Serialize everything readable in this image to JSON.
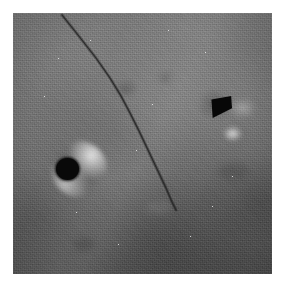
{
  "figure": {
    "kind": "grayscale-micrograph",
    "page_background": "#ffffff",
    "plate": {
      "x": 13,
      "y": 13,
      "width": 259,
      "height": 261,
      "base_gray": "#6e6e6e",
      "lightest_gray": "#8f8f8f",
      "darkest_gray": "#3a3a3a",
      "texture": "fine granular noise with horizontal scan striations"
    },
    "illumination": {
      "direction": "bright toward upper-left and a diagonal mid band, darkening toward lower-right",
      "band_angle_deg": 118
    },
    "features": [
      {
        "name": "dark-circular-particle",
        "shape": "circle",
        "center_x": 67,
        "center_y": 169,
        "radius": 11,
        "fill": "#090909",
        "halo": "bright crescent at upper-right and lower-left"
      },
      {
        "name": "dark-triangular-pit",
        "shape": "triangle",
        "center_x": 222,
        "center_y": 107,
        "width": 21,
        "height": 22,
        "fill": "#070707",
        "orientation": "apex pointing down-left",
        "halo": "bright spot below the apex"
      },
      {
        "name": "diagonal-crack",
        "shape": "polyline",
        "stroke": "#2b2b2b",
        "stroke_width": 1.2,
        "points": [
          [
            62,
            15
          ],
          [
            78,
            35
          ],
          [
            96,
            58
          ],
          [
            110,
            78
          ],
          [
            121,
            96
          ],
          [
            130,
            113
          ],
          [
            139,
            131
          ],
          [
            148,
            150
          ],
          [
            157,
            169
          ],
          [
            166,
            188
          ],
          [
            172,
            202
          ],
          [
            176,
            210
          ]
        ]
      }
    ],
    "smudges": [
      {
        "name": "smudge-a",
        "x": 105,
        "y": 70,
        "tone": "dark"
      },
      {
        "name": "smudge-b",
        "x": 146,
        "y": 60,
        "tone": "dark"
      },
      {
        "name": "smudge-c",
        "x": 133,
        "y": 188,
        "tone": "light"
      },
      {
        "name": "smudge-d",
        "x": 205,
        "y": 150,
        "tone": "dark"
      },
      {
        "name": "smudge-e",
        "x": 60,
        "y": 225,
        "tone": "dark"
      }
    ],
    "specks": [
      [
        90,
        40
      ],
      [
        152,
        104
      ],
      [
        205,
        52
      ],
      [
        76,
        212
      ],
      [
        190,
        236
      ],
      [
        44,
        96
      ],
      [
        232,
        176
      ],
      [
        118,
        244
      ],
      [
        168,
        30
      ],
      [
        58,
        58
      ],
      [
        212,
        206
      ],
      [
        136,
        150
      ]
    ]
  }
}
